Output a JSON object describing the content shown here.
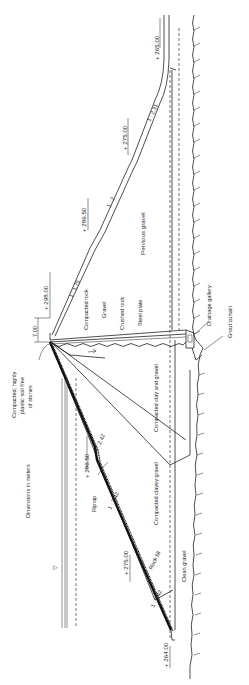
{
  "diagram": {
    "type": "dam-cross-section",
    "orientation": "rotated-90-ccw",
    "note": "Dimensions in meters",
    "crest": {
      "elevation": "+ 298.00",
      "width": "7.00"
    },
    "downstream_slope": {
      "elevations": [
        "+ 298.00",
        "+ 286.50",
        "+ 275.00",
        "+ 265.00"
      ],
      "ratios": [
        "1 : 1.75",
        "1 : 2",
        "1 : 2.31"
      ]
    },
    "upstream_slope": {
      "elevations": [
        "+ 286.50",
        "+ 275.00",
        "+ 264.00"
      ],
      "ratios": [
        "1 : 2.42",
        "1 : 2.42",
        "1 : 2.42"
      ]
    },
    "materials": {
      "compacted_rock": "Compacted rock",
      "gravel": "Gravel",
      "crushed_rock": "Crushed rock",
      "steel_plate": "Steel plate",
      "pervious_gravel": "Pervious gravel",
      "compacted_clay_gravel": "Compacted clay and gravel",
      "compacted_clayey_gravel": "Compacted clayey gravel",
      "clean_gravel": "Clean gravel",
      "rock_fill": "Rock fill",
      "riprap": "Riprap",
      "plastic_soil": [
        "Compacted, highly",
        "plastic soil free",
        "of stones"
      ]
    },
    "features": {
      "drainage_gallery": "Drainage gallery",
      "grout_curtain": "Grout curtain",
      "water_level_symbol": "▽"
    }
  }
}
